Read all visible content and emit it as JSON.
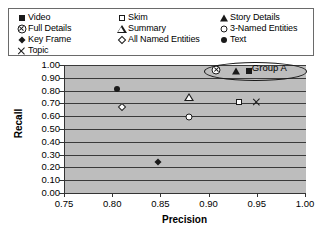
{
  "legend": {
    "columns": [
      {
        "entries": [
          {
            "label": "Video",
            "glyph": "filled-square-icon"
          },
          {
            "label": "Full Details",
            "glyph": "circle-cross-icon"
          },
          {
            "label": "Key Frame",
            "glyph": "filled-diamond-icon"
          },
          {
            "label": "Topic",
            "glyph": "cross-icon"
          }
        ]
      },
      {
        "entries": [
          {
            "label": "Skim",
            "glyph": "open-square-icon"
          },
          {
            "label": "Summary",
            "glyph": "open-triangle-icon"
          },
          {
            "label": "All Named Entities",
            "glyph": "open-diamond-icon"
          }
        ]
      },
      {
        "entries": [
          {
            "label": "Story  Details",
            "glyph": "filled-triangle-icon"
          },
          {
            "label": "3-Named Entities",
            "glyph": "open-circle-icon"
          },
          {
            "label": "Text",
            "glyph": "filled-circle-icon"
          }
        ]
      }
    ]
  },
  "chart_data": {
    "type": "scatter",
    "title": "",
    "xlabel": "Precision",
    "ylabel": "Recall",
    "xlim": [
      0.75,
      1.0
    ],
    "ylim": [
      0.0,
      1.0
    ],
    "xticks": [
      "0.75",
      "0.80",
      "0.85",
      "0.90",
      "0.95",
      "1.00"
    ],
    "xtick_values": [
      0.75,
      0.8,
      0.85,
      0.9,
      0.95,
      1.0
    ],
    "yticks": [
      "0.00",
      "0.10",
      "0.20",
      "0.30",
      "0.40",
      "0.50",
      "0.60",
      "0.70",
      "0.80",
      "0.90",
      "1.00"
    ],
    "ytick_values": [
      0.0,
      0.1,
      0.2,
      0.3,
      0.4,
      0.5,
      0.6,
      0.7,
      0.8,
      0.9,
      1.0
    ],
    "grid": "horizontal",
    "plot_background": "#bdbdbd",
    "legend_position": "top-outside",
    "series": [
      {
        "name": "Video",
        "glyph": "filled-square-icon",
        "x": 0.942,
        "y": 0.955
      },
      {
        "name": "Full Details",
        "glyph": "circle-cross-icon",
        "x": 0.908,
        "y": 0.96
      },
      {
        "name": "Story  Details",
        "glyph": "filled-triangle-icon",
        "x": 0.928,
        "y": 0.955
      },
      {
        "name": "Text",
        "glyph": "filled-circle-icon",
        "x": 0.805,
        "y": 0.81
      },
      {
        "name": "Summary",
        "glyph": "open-triangle-icon",
        "x": 0.88,
        "y": 0.752
      },
      {
        "name": "Skim",
        "glyph": "open-square-icon",
        "x": 0.932,
        "y": 0.712
      },
      {
        "name": "Topic",
        "glyph": "cross-icon",
        "x": 0.95,
        "y": 0.71
      },
      {
        "name": "All Named Entities",
        "glyph": "open-diamond-icon",
        "x": 0.81,
        "y": 0.675
      },
      {
        "name": "3-Named Entities",
        "glyph": "open-circle-icon",
        "x": 0.88,
        "y": 0.59
      },
      {
        "name": "Key Frame",
        "glyph": "filled-diamond-icon",
        "x": 0.848,
        "y": 0.24
      }
    ],
    "annotations": [
      {
        "label": "Group A",
        "shape": "ellipse",
        "encloses": [
          "Full Details",
          "Story  Details",
          "Video"
        ],
        "center_x": 0.948,
        "center_y": 0.955,
        "width_x": 0.105,
        "height_y": 0.135
      }
    ]
  }
}
